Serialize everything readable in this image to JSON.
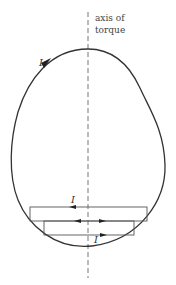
{
  "figure": {
    "axis_label_line1": "axis of",
    "axis_label_line2": "torque",
    "current_label_curve": "I",
    "current_label_top_loop": "I",
    "current_label_bottom_loop": "I"
  },
  "colors": {
    "stroke": "#333333",
    "loop_stroke": "#555555",
    "axis_stroke": "#777777"
  }
}
